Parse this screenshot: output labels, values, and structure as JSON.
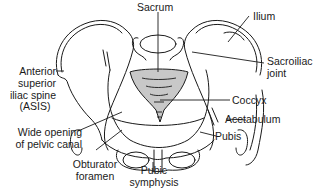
{
  "diagram": {
    "colors": {
      "line": "#1a1a1a",
      "sacrum_fill": "#c8c8c8",
      "background": "#ffffff"
    },
    "labels": {
      "sacrum": "Sacrum",
      "ilium": "Ilium",
      "sacroiliac_joint_1": "Sacroiliac",
      "sacroiliac_joint_2": "joint",
      "asis_1": "Anterior",
      "asis_2": "superior",
      "asis_3": "iliac spine",
      "asis_4": "(ASIS)",
      "coccyx": "Coccyx",
      "acetabulum": "Acetabulum",
      "pubis": "Pubis",
      "wide_opening_1": "Wide opening",
      "wide_opening_2": "of pelvic canal",
      "obturator_1": "Obturator",
      "obturator_2": "foramen",
      "pubic_symphysis_1": "Pubic",
      "pubic_symphysis_2": "symphysis"
    }
  }
}
